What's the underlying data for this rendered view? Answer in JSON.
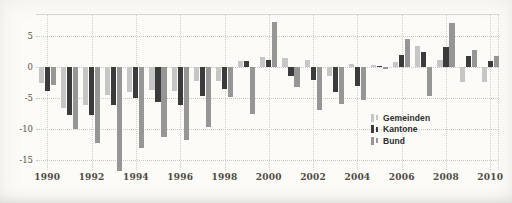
{
  "chart_data": {
    "type": "bar",
    "title": "",
    "xlabel": "",
    "ylabel": "",
    "x": [
      1990,
      1991,
      1992,
      1993,
      1994,
      1995,
      1996,
      1997,
      1998,
      1999,
      2000,
      2001,
      2002,
      2003,
      2004,
      2005,
      2006,
      2007,
      2008,
      2009,
      2010
    ],
    "x_tick_labels": [
      "1990",
      "1992",
      "1994",
      "1996",
      "1998",
      "2000",
      "2002",
      "2004",
      "2006",
      "2008",
      "2010"
    ],
    "y_ticks": [
      5,
      0,
      -5,
      -10,
      -15
    ],
    "y_tick_labels": [
      "5",
      "0",
      "-5",
      "-10",
      "-15"
    ],
    "ylim": [
      -17.3,
      8.6
    ],
    "grid": "dotted; horizontal lines at y ticks, vertical lines at even years",
    "legend_position": "center-right",
    "series": [
      {
        "name": "Gemeinden",
        "color": "#c6c6c6",
        "values": [
          -2.6,
          -6.6,
          -6.1,
          -4.5,
          -4.0,
          -3.7,
          -3.9,
          -2.3,
          -2.3,
          1.0,
          1.6,
          1.4,
          1.1,
          -1.5,
          0.5,
          0.3,
          0.8,
          3.4,
          1.2,
          -2.4,
          -2.4
        ]
      },
      {
        "name": "Kantone",
        "color": "#3b3b3b",
        "values": [
          -3.8,
          -7.8,
          -7.8,
          -6.1,
          -5.0,
          -5.7,
          -6.1,
          -4.7,
          -3.5,
          0.9,
          1.2,
          -1.4,
          -2.1,
          -4.1,
          -3.1,
          0.2,
          2.0,
          2.4,
          3.2,
          1.8,
          1.0
        ]
      },
      {
        "name": "Bund",
        "color": "#969696",
        "values": [
          -2.9,
          -10.0,
          -12.2,
          -16.8,
          -13.0,
          -11.3,
          -11.8,
          -9.7,
          -4.9,
          -7.6,
          7.3,
          -3.2,
          -7.0,
          -5.9,
          -5.3,
          -0.3,
          4.5,
          -4.6,
          7.1,
          2.8,
          1.8
        ]
      }
    ],
    "colors": {
      "paper": "#fcfbf8",
      "grid": "#c9c8c2",
      "axis_text": "#4e4a42"
    }
  },
  "legend": {
    "items": [
      {
        "label": "Gemeinden"
      },
      {
        "label": "Kantone"
      },
      {
        "label": "Bund"
      }
    ]
  }
}
